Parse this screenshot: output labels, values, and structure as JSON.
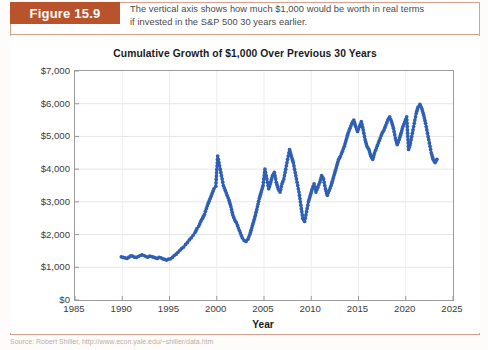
{
  "figure": {
    "tag_label": "Figure 15.9",
    "caption_line1": "The vertical axis shows how much $1,000 would be worth in real terms",
    "caption_line2": "if invested in the S&P 500 30 years earlier.",
    "accent_color": "#b9532c",
    "rule_color": "#d7a08f",
    "source_text": "Source: Robert Shiller, http://www.econ.yale.edu/~shiller/data.htm"
  },
  "chart_data": {
    "type": "line",
    "title": "Cumulative Growth of $1,000 Over Previous 30 Years",
    "xlabel": "Year",
    "ylabel": "",
    "xlim": [
      1985,
      2025
    ],
    "ylim": [
      0,
      7000
    ],
    "grid": true,
    "legend": "none",
    "marker": "circle",
    "series_color": "#2f5fb4",
    "xticks": [
      1985,
      1990,
      1995,
      2000,
      2005,
      2010,
      2015,
      2020,
      2025
    ],
    "xtick_labels": [
      "1985",
      "1990",
      "1995",
      "2000",
      "2005",
      "2010",
      "2015",
      "2020",
      "2025"
    ],
    "yticks": [
      0,
      1000,
      2000,
      3000,
      4000,
      5000,
      6000,
      7000
    ],
    "ytick_labels": [
      "$0",
      "$1,000",
      "$2,000",
      "$3,000",
      "$4,000",
      "$5,000",
      "$6,000",
      "$7,000"
    ],
    "series": [
      {
        "name": "Cumulative growth of $1,000 over previous 30 years",
        "x": [
          1989.9,
          1990.1,
          1990.3,
          1990.5,
          1990.7,
          1990.9,
          1991.1,
          1991.3,
          1991.5,
          1991.7,
          1991.9,
          1992.1,
          1992.3,
          1992.5,
          1992.7,
          1992.9,
          1993.1,
          1993.3,
          1993.5,
          1993.7,
          1993.9,
          1994.1,
          1994.3,
          1994.5,
          1994.7,
          1994.9,
          1995.1,
          1995.3,
          1995.5,
          1995.7,
          1995.9,
          1996.1,
          1996.3,
          1996.5,
          1996.7,
          1996.9,
          1997.1,
          1997.3,
          1997.5,
          1997.7,
          1997.9,
          1998.1,
          1998.3,
          1998.5,
          1998.7,
          1998.9,
          1999.1,
          1999.3,
          1999.5,
          1999.7,
          1999.9,
          2000.1,
          2000.3,
          2000.5,
          2000.7,
          2000.9,
          2001.1,
          2001.3,
          2001.5,
          2001.7,
          2001.9,
          2002.1,
          2002.3,
          2002.5,
          2002.7,
          2002.9,
          2003.1,
          2003.3,
          2003.5,
          2003.7,
          2003.9,
          2004.1,
          2004.3,
          2004.5,
          2004.7,
          2004.9,
          2005.1,
          2005.3,
          2005.5,
          2005.7,
          2005.9,
          2006.1,
          2006.3,
          2006.5,
          2006.7,
          2006.9,
          2007.1,
          2007.3,
          2007.5,
          2007.7,
          2007.9,
          2008.1,
          2008.3,
          2008.5,
          2008.7,
          2008.9,
          2009.1,
          2009.3,
          2009.5,
          2009.7,
          2009.9,
          2010.1,
          2010.3,
          2010.5,
          2010.7,
          2010.9,
          2011.1,
          2011.3,
          2011.5,
          2011.7,
          2011.9,
          2012.1,
          2012.3,
          2012.5,
          2012.7,
          2012.9,
          2013.1,
          2013.3,
          2013.5,
          2013.7,
          2013.9,
          2014.1,
          2014.3,
          2014.5,
          2014.7,
          2014.9,
          2015.1,
          2015.3,
          2015.5,
          2015.7,
          2015.9,
          2016.1,
          2016.3,
          2016.5,
          2016.7,
          2016.9,
          2017.1,
          2017.3,
          2017.5,
          2017.7,
          2017.9,
          2018.1,
          2018.3,
          2018.5,
          2018.7,
          2018.9,
          2019.1,
          2019.3,
          2019.5,
          2019.7,
          2019.9,
          2020.1,
          2020.3,
          2020.5,
          2020.7,
          2020.9,
          2021.1,
          2021.3,
          2021.5,
          2021.7,
          2021.9,
          2022.1,
          2022.3,
          2022.5,
          2022.7,
          2022.9,
          2023.1,
          2023.3
        ],
        "values": [
          1320,
          1300,
          1290,
          1270,
          1310,
          1350,
          1340,
          1310,
          1300,
          1330,
          1360,
          1380,
          1360,
          1330,
          1310,
          1340,
          1330,
          1310,
          1290,
          1270,
          1300,
          1290,
          1260,
          1240,
          1220,
          1250,
          1260,
          1300,
          1360,
          1400,
          1460,
          1520,
          1580,
          1620,
          1700,
          1760,
          1840,
          1900,
          1980,
          2060,
          2180,
          2260,
          2400,
          2500,
          2620,
          2800,
          2960,
          3100,
          3250,
          3400,
          3480,
          4400,
          4100,
          3800,
          3500,
          3350,
          3200,
          3050,
          2850,
          2600,
          2450,
          2350,
          2200,
          2050,
          1900,
          1820,
          1790,
          1860,
          2000,
          2200,
          2400,
          2600,
          2850,
          3100,
          3300,
          3500,
          4000,
          3700,
          3400,
          3600,
          3800,
          3900,
          3600,
          3400,
          3300,
          3550,
          3700,
          4000,
          4300,
          4600,
          4400,
          4200,
          3900,
          3600,
          3300,
          2900,
          2500,
          2400,
          2700,
          3000,
          3200,
          3400,
          3550,
          3300,
          3450,
          3600,
          3800,
          3700,
          3400,
          3200,
          3350,
          3500,
          3700,
          3900,
          4100,
          4300,
          4400,
          4550,
          4700,
          4900,
          5100,
          5250,
          5400,
          5500,
          5300,
          5150,
          5300,
          5450,
          5200,
          4900,
          4700,
          4600,
          4400,
          4300,
          4500,
          4650,
          4800,
          4950,
          5100,
          5200,
          5350,
          5500,
          5600,
          5450,
          5250,
          4950,
          4750,
          4900,
          5100,
          5300,
          5450,
          5600,
          4600,
          4800,
          5100,
          5400,
          5700,
          5900,
          5980,
          5850,
          5650,
          5400,
          5100,
          4800,
          4500,
          4300,
          4200,
          4300
        ]
      }
    ],
    "notes": {
      "start_year": 1990,
      "end_year": 2023,
      "approx_min": 1220,
      "approx_max": 5980,
      "observation": "Dot-line series with circular markers; peaks near 2000 (~$4,400), 2007 (~$4,600), 2014-2015 (~$5,500) and 2021 (~$6,000); troughs near 1994 (~$1,250), 2002-2003 (~$1,800) and 2009 (~$2,400)."
    }
  }
}
